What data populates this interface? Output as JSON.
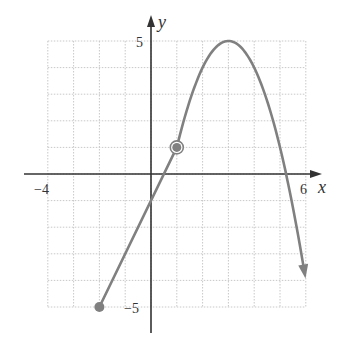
{
  "chart_data": {
    "type": "line",
    "title": "",
    "xlabel": "x",
    "ylabel": "y",
    "xlim": [
      -4,
      6
    ],
    "ylim": [
      -5,
      5
    ],
    "grid": true,
    "tick_labels": {
      "x": [
        {
          "value": -4,
          "label": "−4"
        },
        {
          "value": 6,
          "label": "6"
        }
      ],
      "y": [
        {
          "value": 5,
          "label": "5"
        },
        {
          "value": -5,
          "label": "−5"
        }
      ]
    },
    "series": [
      {
        "name": "linear piece",
        "equation": "y = 2x - 1",
        "domain": [
          -2,
          1
        ],
        "start": {
          "x": -2,
          "y": -5,
          "endpoint": "closed"
        },
        "end": {
          "x": 1,
          "y": 1,
          "endpoint": "open"
        },
        "color": "#808080"
      },
      {
        "name": "parabolic piece",
        "equation": "y = 5 - (x - 3)^2",
        "domain": [
          1,
          6
        ],
        "start": {
          "x": 1,
          "y": 1,
          "endpoint": "closed"
        },
        "vertex": {
          "x": 3,
          "y": 5
        },
        "end": {
          "x": 5.95,
          "y": -3.7,
          "endpoint": "arrow"
        },
        "color": "#808080"
      }
    ],
    "points": [
      {
        "x": -2,
        "y": -5,
        "style": "closed"
      },
      {
        "x": 1,
        "y": 1,
        "style": "closed-over-open"
      }
    ]
  },
  "labels": {
    "x_axis": "x",
    "y_axis": "y",
    "x_min": "−4",
    "x_max": "6",
    "y_max": "5",
    "y_min": "−5"
  },
  "colors": {
    "curve": "#808080",
    "axis": "#333333",
    "grid": "#c8c8c8"
  }
}
